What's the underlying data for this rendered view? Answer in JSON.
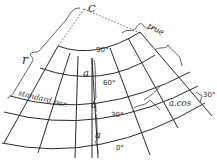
{
  "diagram": {
    "type": "conic map projection construction",
    "apex_label": "C",
    "radius_label": "r",
    "standard_parallel_label": "standard par.",
    "true_label": "true",
    "meridian_segment_label": "a",
    "parallel_segment_label": "a.cos",
    "angle_label": "30°",
    "latitude_labels": [
      "90°",
      "60°",
      "30°",
      "0°"
    ],
    "colors": {
      "ink": "#2a2a2a",
      "background": "#ffffff"
    }
  }
}
